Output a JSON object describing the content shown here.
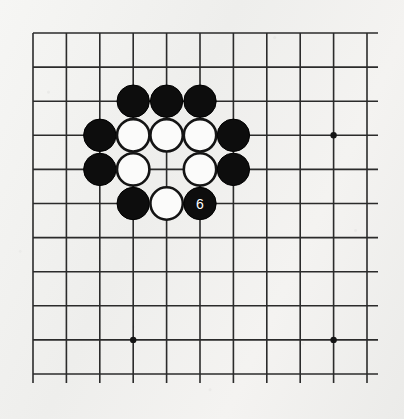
{
  "figure": {
    "kind": "go-board-diagram",
    "width": 404,
    "height": 419,
    "background_color": "#f2f2f0",
    "line_color": "#2b2b2b",
    "black_stone_color": "#0d0d0d",
    "white_stone_color": "#fbfbfa",
    "white_stone_outline_color": "#141414",
    "label_text_color": "#ffffff"
  },
  "board": {
    "columns": 11,
    "rows": 11,
    "origin_x": 33,
    "origin_y": 33,
    "spacing_x": 33.4,
    "spacing_y": 34.1,
    "horizontal_line_overhang_right": 11,
    "vertical_line_overhang_bottom": 9,
    "star_points": [
      {
        "name": "star-point-lower-left",
        "col": 3,
        "row": 9
      },
      {
        "name": "star-point-upper-right",
        "col": 9,
        "row": 3
      },
      {
        "name": "star-point-lower-right",
        "col": 9,
        "row": 9
      }
    ]
  },
  "stones": [
    {
      "name": "black-stone-d3",
      "color": "black",
      "col": 3,
      "row": 2,
      "label": ""
    },
    {
      "name": "black-stone-e3",
      "color": "black",
      "col": 4,
      "row": 2,
      "label": ""
    },
    {
      "name": "black-stone-f3",
      "color": "black",
      "col": 5,
      "row": 2,
      "label": ""
    },
    {
      "name": "black-stone-c4",
      "color": "black",
      "col": 2,
      "row": 3,
      "label": ""
    },
    {
      "name": "white-stone-d4",
      "color": "white",
      "col": 3,
      "row": 3,
      "label": ""
    },
    {
      "name": "white-stone-e4",
      "color": "white",
      "col": 4,
      "row": 3,
      "label": ""
    },
    {
      "name": "white-stone-f4",
      "color": "white",
      "col": 5,
      "row": 3,
      "label": ""
    },
    {
      "name": "black-stone-g4",
      "color": "black",
      "col": 6,
      "row": 3,
      "label": ""
    },
    {
      "name": "black-stone-c5",
      "color": "black",
      "col": 2,
      "row": 4,
      "label": ""
    },
    {
      "name": "white-stone-d5",
      "color": "white",
      "col": 3,
      "row": 4,
      "label": ""
    },
    {
      "name": "white-stone-f5",
      "color": "white",
      "col": 5,
      "row": 4,
      "label": ""
    },
    {
      "name": "black-stone-g5",
      "color": "black",
      "col": 6,
      "row": 4,
      "label": ""
    },
    {
      "name": "black-stone-d6",
      "color": "black",
      "col": 3,
      "row": 5,
      "label": ""
    },
    {
      "name": "white-stone-e6",
      "color": "white",
      "col": 4,
      "row": 5,
      "label": ""
    },
    {
      "name": "black-stone-move-6",
      "color": "black",
      "col": 5,
      "row": 5,
      "label": "6"
    }
  ],
  "stone_radius": 16.2,
  "star_point_radius": 3.2,
  "empty_intersection_note": "col 4 row 4 is empty (ko / eye point)"
}
